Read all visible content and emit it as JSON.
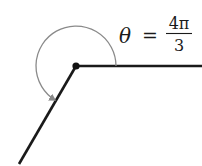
{
  "diagram": {
    "type": "angle-in-standard-position",
    "label": {
      "symbol": "θ",
      "equals": "=",
      "numerator": "4π",
      "denominator": "3"
    },
    "angle_radians_text": "4π/3",
    "colors": {
      "rays": "#1a1a1a",
      "arc": "#8a8a8a",
      "vertex": "#111111"
    }
  }
}
